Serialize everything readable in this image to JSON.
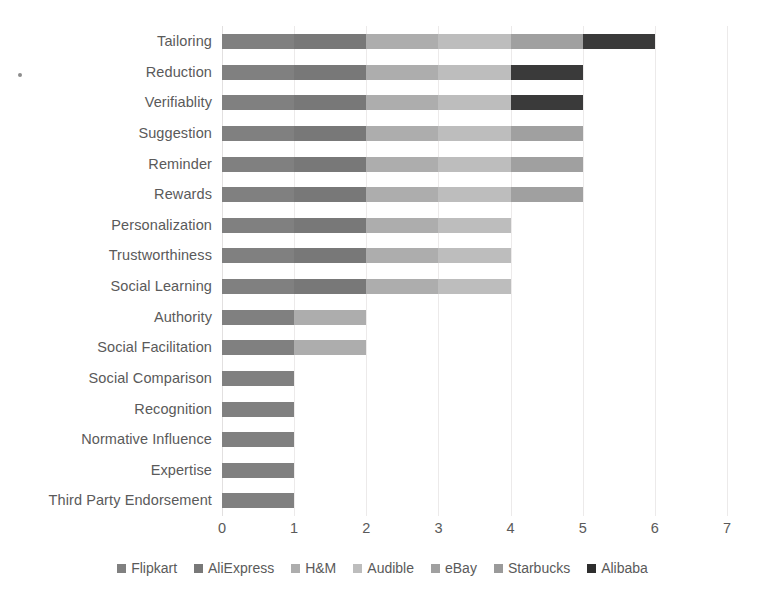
{
  "chart_data": {
    "type": "bar",
    "orientation": "horizontal",
    "stacked": true,
    "title": "",
    "subtitle": "",
    "xlabel": "",
    "ylabel": "",
    "xlim": [
      0,
      7
    ],
    "xticks": [
      "0",
      "1",
      "2",
      "3",
      "4",
      "5",
      "6",
      "7"
    ],
    "grid": true,
    "legend_position": "bottom",
    "categories": [
      "Tailoring",
      "Reduction",
      "Verifiablity",
      "Suggestion",
      "Reminder",
      "Rewards",
      "Personalization",
      "Trustworthiness",
      "Social Learning",
      "Authority",
      "Social Facilitation",
      "Social Comparison",
      "Recognition",
      "Normative Influence",
      "Expertise",
      "Third Party Endorsement"
    ],
    "series": [
      {
        "name": "Flipkart",
        "color": "#808080",
        "values": [
          1,
          1,
          1,
          1,
          1,
          1,
          1,
          1,
          1,
          1,
          1,
          1,
          1,
          1,
          1,
          1
        ]
      },
      {
        "name": "AliExpress",
        "color": "#787878",
        "values": [
          1,
          1,
          1,
          1,
          1,
          1,
          1,
          1,
          1,
          0,
          0,
          0,
          0,
          0,
          0,
          0
        ]
      },
      {
        "name": "H&M",
        "color": "#adadad",
        "values": [
          1,
          1,
          1,
          1,
          1,
          1,
          1,
          1,
          1,
          1,
          1,
          0,
          0,
          0,
          0,
          0
        ]
      },
      {
        "name": "Audible",
        "color": "#bdbdbd",
        "values": [
          1,
          1,
          1,
          1,
          1,
          1,
          1,
          1,
          1,
          0,
          0,
          0,
          0,
          0,
          0,
          0
        ]
      },
      {
        "name": "eBay",
        "color": "#a0a0a0",
        "values": [
          1,
          0,
          0,
          1,
          1,
          1,
          0,
          0,
          0,
          0,
          0,
          0,
          0,
          0,
          0,
          0
        ]
      },
      {
        "name": "Starbucks",
        "color": "#9a9a9a",
        "values": [
          0,
          0,
          0,
          0,
          0,
          0,
          0,
          0,
          0,
          0,
          0,
          0,
          0,
          0,
          0,
          0
        ]
      },
      {
        "name": "Alibaba",
        "color": "#3a3a3a",
        "values": [
          1,
          1,
          1,
          0,
          0,
          0,
          0,
          0,
          0,
          0,
          0,
          0,
          0,
          0,
          0,
          0
        ]
      }
    ],
    "totals": [
      6,
      5,
      5,
      5,
      5,
      5,
      4,
      4,
      4,
      2,
      2,
      1,
      1,
      1,
      1,
      1
    ]
  },
  "legend": {
    "items": [
      {
        "label": "Flipkart",
        "color": "#808080"
      },
      {
        "label": "AliExpress",
        "color": "#787878"
      },
      {
        "label": "H&M",
        "color": "#adadad"
      },
      {
        "label": "Audible",
        "color": "#bdbdbd"
      },
      {
        "label": "eBay",
        "color": "#a0a0a0"
      },
      {
        "label": "Starbucks",
        "color": "#9a9a9a"
      },
      {
        "label": "Alibaba",
        "color": "#2e2e2e"
      }
    ]
  },
  "style": {
    "gridline_color": "#eceaea",
    "text_color": "#5a5a5a",
    "background": "#ffffff"
  }
}
